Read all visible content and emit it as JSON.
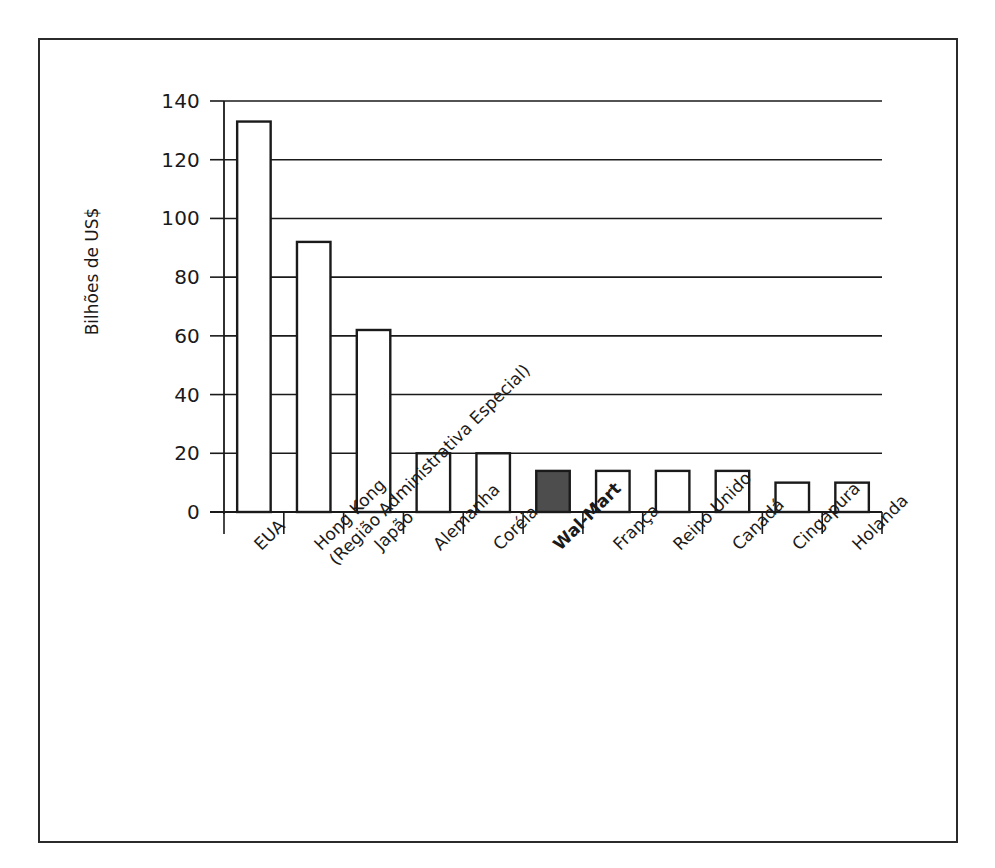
{
  "figure": {
    "frame_color": "#2b2b2b",
    "background": "#ffffff"
  },
  "chart_data": {
    "type": "bar",
    "title": "",
    "subtitle": "",
    "xlabel": "",
    "ylabel": "Bilhões de US$",
    "ylim": [
      0,
      140
    ],
    "yticks": [
      0,
      20,
      40,
      60,
      80,
      100,
      120,
      140
    ],
    "ytick_labels": [
      "0",
      "20",
      "40",
      "60",
      "80",
      "100",
      "120",
      "140"
    ],
    "grid": true,
    "grid_axis": "y",
    "legend": false,
    "legend_position": "none",
    "bar_style": {
      "default_fill": "#ffffff",
      "default_edge": "#1a1a1a",
      "highlight_fill": "#4d4d4d",
      "highlight_edge": "#1a1a1a"
    },
    "categories": [
      "EUA",
      "Hong Kong (Região Administrativa Especial)",
      "Japão",
      "Alemanha",
      "Coréia",
      "Wal-Mart",
      "França",
      "Reino Unido",
      "Canadá",
      "Cingapura",
      "Holanda"
    ],
    "category_labels": [
      {
        "line1": "EUA",
        "line2": "",
        "highlight": false
      },
      {
        "line1": "Hong Kong",
        "line2": "(Região Administrativa Especial)",
        "highlight": false
      },
      {
        "line1": "Japão",
        "line2": "",
        "highlight": false
      },
      {
        "line1": "Alemanha",
        "line2": "",
        "highlight": false
      },
      {
        "line1": "Coréia",
        "line2": "",
        "highlight": false
      },
      {
        "line1": "Wal-Mart",
        "line2": "",
        "highlight": true
      },
      {
        "line1": "França",
        "line2": "",
        "highlight": false
      },
      {
        "line1": "Reino Unido",
        "line2": "",
        "highlight": false
      },
      {
        "line1": "Canadá",
        "line2": "",
        "highlight": false
      },
      {
        "line1": "Cingapura",
        "line2": "",
        "highlight": false
      },
      {
        "line1": "Holanda",
        "line2": "",
        "highlight": false
      }
    ],
    "values": [
      133,
      92,
      62,
      20,
      20,
      14,
      14,
      14,
      14,
      10,
      10
    ],
    "highlighted_index": 5
  }
}
